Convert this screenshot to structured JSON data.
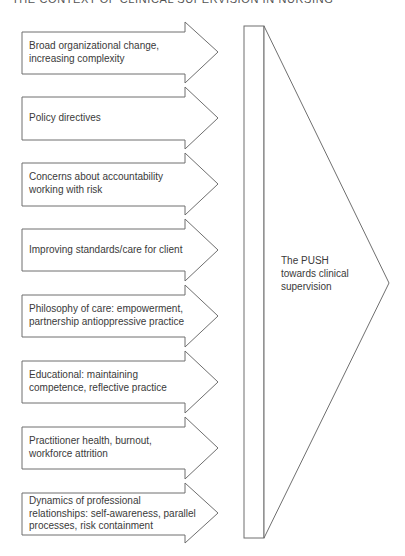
{
  "header": {
    "title": "THE CONTEXT OF CLINICAL SUPERVISION IN NURSING"
  },
  "colors": {
    "stroke": "#6f6f6f",
    "background": "#ffffff",
    "text": "#3a3a3a"
  },
  "arrows": [
    {
      "label": "Broad organizational change, increasing complexity"
    },
    {
      "label": "Policy directives"
    },
    {
      "label": "Concerns about accountability working with risk"
    },
    {
      "label": "Improving standards/care for client"
    },
    {
      "label": "Philosophy of care: empowerment, partnership antioppressive practice"
    },
    {
      "label": "Educational: maintaining competence, reflective practice"
    },
    {
      "label": "Practitioner health, burnout, workforce attrition"
    },
    {
      "label": "Dynamics of professional relationships: self-awareness, parallel processes, risk containment"
    }
  ],
  "push_arrow": {
    "label": "The PUSH towards clinical supervision"
  }
}
